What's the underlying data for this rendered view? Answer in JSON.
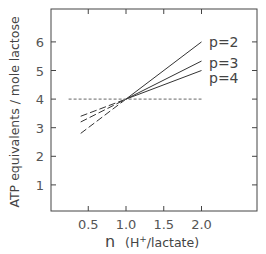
{
  "chart_data": {
    "type": "line",
    "title": "",
    "xlabel": "n  (H+/lactate)",
    "ylabel": "ATP equivalents / mole lactose",
    "xlim": [
      0.0,
      2.7
    ],
    "ylim": [
      0,
      7
    ],
    "xticks": [
      0.5,
      1.0,
      1.5,
      2.0
    ],
    "xtick_labels": [
      "0.5",
      "1.0",
      "1.5",
      "2.0"
    ],
    "yticks": [
      1,
      2,
      3,
      4,
      5,
      6
    ],
    "ytick_labels": [
      "1",
      "2",
      "3",
      "4",
      "5",
      "6"
    ],
    "grid": false,
    "series": [
      {
        "name": "p=2",
        "label": "p=2",
        "x": [
          0.4,
          1.0,
          2.0
        ],
        "values": [
          2.8,
          4.0,
          6.0
        ],
        "style": "solid-right/dashed-left"
      },
      {
        "name": "p=3",
        "label": "p=3",
        "x": [
          0.4,
          1.0,
          2.0
        ],
        "values": [
          3.2,
          4.0,
          5.33
        ],
        "style": "solid-right/dashed-left"
      },
      {
        "name": "p=4",
        "label": "p=4",
        "x": [
          0.4,
          1.0,
          2.0
        ],
        "values": [
          3.4,
          4.0,
          5.0
        ],
        "style": "solid-right/dashed-left"
      },
      {
        "name": "reference",
        "label": "",
        "x": [
          0.2,
          2.0
        ],
        "values": [
          4.0,
          4.0
        ],
        "style": "dashed"
      }
    ]
  },
  "labels": {
    "xlabel_main": "n",
    "xlabel_unit_open": "(H",
    "xlabel_sup": "+",
    "xlabel_unit_close": "/lactate)",
    "ylabel": "ATP equivalents / mole lactose"
  }
}
